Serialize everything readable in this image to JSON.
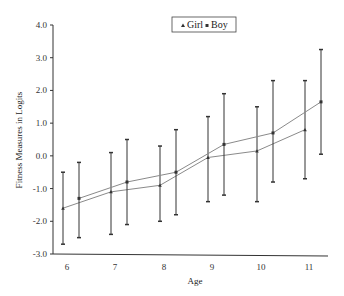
{
  "chart_data": {
    "type": "line",
    "title": "",
    "xlabel": "Age",
    "ylabel": "Fitness Measures in Logits",
    "ylim": [
      -3.0,
      4.0
    ],
    "yticks": [
      "4.0",
      "3.0",
      "2.0",
      "1.0",
      "0.0",
      "-1.0",
      "-2.0",
      "-3.0"
    ],
    "categories": [
      "6",
      "7",
      "8",
      "9",
      "10",
      "11"
    ],
    "grid": false,
    "legend_position": "top-center",
    "error_bars": true,
    "series": [
      {
        "name": "Girl",
        "marker": "triangle",
        "values": [
          -1.6,
          -1.1,
          -0.9,
          -0.05,
          0.15,
          0.8
        ],
        "upper": [
          -0.5,
          0.1,
          0.3,
          1.2,
          1.5,
          2.3
        ],
        "lower": [
          -2.7,
          -2.4,
          -2.0,
          -1.4,
          -1.4,
          -0.7
        ]
      },
      {
        "name": "Boy",
        "marker": "square",
        "values": [
          -1.3,
          -0.8,
          -0.5,
          0.35,
          0.7,
          1.65
        ],
        "upper": [
          -0.2,
          0.5,
          0.8,
          1.9,
          2.3,
          3.25
        ],
        "lower": [
          -2.5,
          -2.1,
          -1.8,
          -1.2,
          -0.8,
          0.05
        ]
      }
    ]
  },
  "legend": {
    "items": [
      {
        "label": "Girl",
        "marker": "triangle"
      },
      {
        "label": "Boy",
        "marker": "square"
      }
    ]
  },
  "colors": {
    "line": "#8a8a8a",
    "errorbar": "#333333",
    "axis": "#333333"
  }
}
